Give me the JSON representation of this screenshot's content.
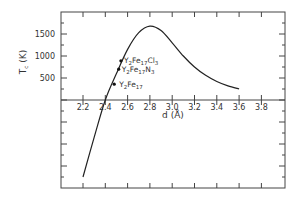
{
  "chart_data": {
    "type": "line",
    "title": "",
    "xlabel": "d (Å)",
    "ylabel": "Tc (K)",
    "xlim": [
      2.2,
      3.8
    ],
    "ylim": [
      -1750,
      1900
    ],
    "x_ticks": [
      "2.2",
      "2.4",
      "2.6",
      "2.8",
      "3.0",
      "3.2",
      "3.4",
      "3.6",
      "3.8"
    ],
    "y_ticks": [
      "500",
      "1000",
      "1500"
    ],
    "grid": false,
    "legend": null,
    "series": [
      {
        "name": "Tc vs Fe-Fe distance",
        "x": [
          2.2,
          2.3,
          2.4,
          2.5,
          2.6,
          2.7,
          2.8,
          2.9,
          3.0,
          3.1,
          3.2,
          3.3,
          3.4,
          3.5,
          3.6
        ],
        "y": [
          -1750,
          -850,
          0,
          600,
          1150,
          1530,
          1680,
          1580,
          1300,
          1000,
          750,
          560,
          420,
          320,
          250
        ]
      }
    ],
    "points": [
      {
        "label": "Y2Fe17Cl3",
        "x": 2.54,
        "y": 890
      },
      {
        "label": "Y2Fe17N3",
        "x": 2.52,
        "y": 700
      },
      {
        "label": "Y2Fe17",
        "x": 2.48,
        "y": 360
      }
    ],
    "annotations": [
      {
        "base": "Y",
        "parts": [
          [
            "2",
            "sub"
          ],
          [
            "Fe",
            ""
          ],
          [
            "17",
            "sub"
          ],
          [
            "Cl",
            ""
          ],
          [
            "3",
            "sub"
          ]
        ]
      },
      {
        "base": "Y",
        "parts": [
          [
            "2",
            "sub"
          ],
          [
            "Fe",
            ""
          ],
          [
            "17",
            "sub"
          ],
          [
            "N",
            ""
          ],
          [
            "3",
            "sub"
          ]
        ]
      },
      {
        "base": "Y",
        "parts": [
          [
            "2",
            "sub"
          ],
          [
            "Fe",
            ""
          ],
          [
            "17",
            "sub"
          ]
        ]
      }
    ]
  },
  "labels": {
    "xlabel": "d (Å)",
    "ylabel_main": "T",
    "ylabel_sub": "c",
    "ylabel_unit": " (K)"
  }
}
